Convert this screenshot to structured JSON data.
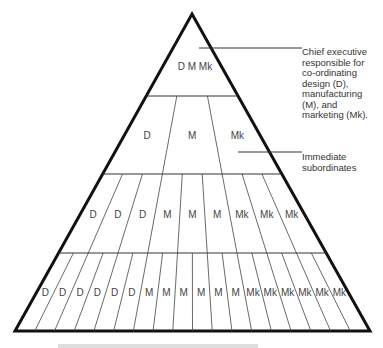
{
  "diagram": {
    "type": "hierarchy-pyramid",
    "levels": [
      {
        "name": "chief-executive",
        "labels": [
          "D",
          "M",
          "Mk"
        ],
        "grouped": true
      },
      {
        "name": "immediate-subordinates",
        "labels": [
          "D",
          "M",
          "Mk"
        ]
      },
      {
        "name": "level-3",
        "labels": [
          "D",
          "D",
          "D",
          "M",
          "M",
          "M",
          "Mk",
          "Mk",
          "Mk"
        ]
      },
      {
        "name": "level-4",
        "labels": [
          "D",
          "D",
          "D",
          "D",
          "D",
          "D",
          "M",
          "M",
          "M",
          "M",
          "M",
          "M",
          "Mk",
          "Mk",
          "Mk",
          "Mk",
          "Mk",
          "Mk"
        ]
      }
    ],
    "annotations": [
      {
        "id": "chief",
        "lines": [
          "Chief executive",
          "responsible for",
          "co-ordinating",
          "design (D),",
          "manufacturing",
          "(M), and",
          "marketing (Mk)."
        ]
      },
      {
        "id": "subordinates",
        "lines": [
          "Immediate",
          "subordinates"
        ]
      }
    ]
  }
}
